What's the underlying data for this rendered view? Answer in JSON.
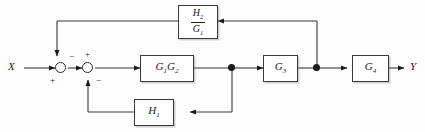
{
  "diagram": {
    "type": "block-diagram",
    "colors": {
      "line": "#3a3a3a",
      "block_border": "#3a3a3a",
      "background": "#fdfdfd",
      "text": "#1a1a1a"
    },
    "io": {
      "input_label": "X",
      "output_label": "Y"
    },
    "blocks": [
      {
        "id": "forward-1",
        "label": "G₁G₂",
        "label_base": "G",
        "parts": [
          {
            "base": "G",
            "sub": "1"
          },
          {
            "base": "G",
            "sub": "2"
          }
        ]
      },
      {
        "id": "forward-2",
        "label": "G₃",
        "parts": [
          {
            "base": "G",
            "sub": "3"
          }
        ]
      },
      {
        "id": "forward-3",
        "label": "G₄",
        "parts": [
          {
            "base": "G",
            "sub": "4"
          }
        ]
      },
      {
        "id": "feedback-inner",
        "label": "H₁",
        "parts": [
          {
            "base": "H",
            "sub": "1"
          }
        ]
      },
      {
        "id": "feedback-outer",
        "label": "H₂/G₁",
        "numerator": {
          "base": "H",
          "sub": "2"
        },
        "denominator": {
          "base": "G",
          "sub": "1"
        }
      }
    ],
    "summing_junctions": [
      {
        "id": "sum-1",
        "signs": [
          {
            "value": "+",
            "position": "bottom-left",
            "source": "input-X"
          },
          {
            "value": "−",
            "position": "top-right",
            "source": "feedback-outer"
          }
        ]
      },
      {
        "id": "sum-2",
        "signs": [
          {
            "value": "+",
            "position": "top-left",
            "source": "sum-1"
          },
          {
            "value": "−",
            "position": "bottom-right",
            "source": "feedback-inner"
          }
        ]
      }
    ],
    "takeoff_points": [
      {
        "id": "takeoff-inner",
        "after": "forward-1",
        "feeds": "feedback-inner"
      },
      {
        "id": "takeoff-outer",
        "after": "forward-2",
        "feeds": "feedback-outer"
      }
    ],
    "signal_path": [
      "X",
      "sum-1",
      "sum-2",
      "G₁G₂",
      "takeoff-inner",
      "G₃",
      "takeoff-outer",
      "G₄",
      "Y"
    ]
  }
}
